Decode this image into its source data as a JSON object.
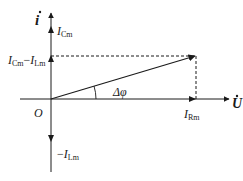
{
  "diagram": {
    "type": "phasor-diagram",
    "colors": {
      "stroke": "#1a1a1a",
      "background": "#ffffff"
    },
    "axes": {
      "vertical": {
        "label": "i",
        "label_style": "bold-italic-dot"
      },
      "horizontal": {
        "label": "U",
        "label_style": "bold-italic-dot"
      },
      "origin": {
        "label": "O"
      }
    },
    "labels": {
      "i_axis": "i",
      "u_axis": "U",
      "origin": "O",
      "i_cm_main": "I",
      "i_cm_sub": "Cm",
      "diff_main1": "I",
      "diff_sub1": "Cm",
      "diff_minus": "−",
      "diff_main2": "I",
      "diff_sub2": "Lm",
      "neg_minus": "−",
      "neg_main": "I",
      "neg_sub": "Lm",
      "i_rm_main": "I",
      "i_rm_sub": "Rm",
      "angle": "Δφ"
    },
    "vectors": [
      {
        "name": "I_Cm",
        "direction": "up"
      },
      {
        "name": "I_Cm - I_Lm",
        "direction": "up"
      },
      {
        "name": "-I_Lm",
        "direction": "down"
      },
      {
        "name": "I_Rm",
        "direction": "right"
      },
      {
        "name": "resultant",
        "direction": "up-right"
      }
    ]
  }
}
